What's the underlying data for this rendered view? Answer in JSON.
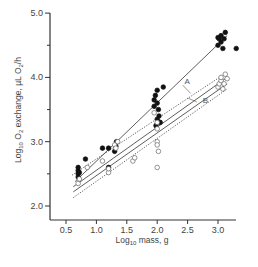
{
  "chart_data": {
    "type": "scatter",
    "title": "",
    "xlabel": "Log10 mass, g",
    "ylabel": "Log10 O2 exchange, µL O2/h",
    "xlim": [
      0.35,
      3.3
    ],
    "ylim": [
      1.8,
      5.0
    ],
    "x_ticks": [
      0.5,
      1.0,
      1.5,
      2.0,
      2.5,
      3.0
    ],
    "x_tick_labels": [
      "0.5",
      "1.0",
      "1.5",
      "2.0",
      "2.5",
      "3.0"
    ],
    "y_ticks": [
      2.0,
      3.0,
      4.0,
      5.0
    ],
    "y_tick_labels": [
      "2.0",
      "3.0",
      "4.0",
      "5.0"
    ],
    "y_minor_ticks": [
      2.5,
      3.5,
      4.5
    ],
    "grid": false,
    "legend": null,
    "series": [
      {
        "name": "filled circles",
        "marker": "filled-circle",
        "points": [
          [
            0.7,
            2.45
          ],
          [
            0.7,
            2.5
          ],
          [
            0.7,
            2.55
          ],
          [
            0.7,
            2.6
          ],
          [
            0.72,
            2.52
          ],
          [
            0.82,
            2.73
          ],
          [
            1.1,
            2.9
          ],
          [
            1.2,
            2.9
          ],
          [
            1.2,
            2.6
          ],
          [
            1.3,
            2.85
          ],
          [
            1.32,
            2.93
          ],
          [
            1.33,
            3.0
          ],
          [
            1.95,
            3.55
          ],
          [
            1.95,
            3.65
          ],
          [
            1.97,
            3.72
          ],
          [
            2.0,
            3.6
          ],
          [
            2.0,
            3.8
          ],
          [
            2.02,
            3.5
          ],
          [
            2.03,
            3.4
          ],
          [
            2.05,
            3.3
          ],
          [
            1.98,
            3.25
          ],
          [
            2.0,
            3.35
          ],
          [
            2.1,
            3.85
          ],
          [
            3.0,
            4.5
          ],
          [
            3.02,
            4.6
          ],
          [
            3.05,
            4.55
          ],
          [
            3.05,
            4.65
          ],
          [
            3.08,
            4.45
          ],
          [
            3.1,
            4.6
          ],
          [
            3.12,
            4.7
          ],
          [
            3.0,
            4.62
          ],
          [
            3.3,
            4.45
          ]
        ]
      },
      {
        "name": "open circles",
        "marker": "open-circle",
        "points": [
          [
            0.7,
            2.35
          ],
          [
            0.72,
            2.42
          ],
          [
            0.85,
            2.6
          ],
          [
            1.1,
            2.7
          ],
          [
            1.2,
            2.52
          ],
          [
            1.2,
            2.58
          ],
          [
            1.3,
            2.95
          ],
          [
            1.32,
            2.9
          ],
          [
            1.35,
            3.0
          ],
          [
            1.6,
            2.7
          ],
          [
            1.63,
            2.75
          ],
          [
            1.95,
            3.45
          ],
          [
            2.0,
            3.3
          ],
          [
            2.0,
            3.2
          ],
          [
            2.0,
            3.0
          ],
          [
            2.0,
            2.95
          ],
          [
            2.02,
            2.85
          ],
          [
            2.0,
            2.6
          ],
          [
            3.0,
            3.85
          ],
          [
            3.02,
            3.9
          ],
          [
            3.05,
            3.95
          ],
          [
            3.05,
            4.0
          ],
          [
            3.08,
            3.82
          ],
          [
            3.1,
            3.9
          ],
          [
            3.12,
            4.05
          ],
          [
            3.15,
            3.98
          ]
        ]
      }
    ],
    "fit_lines": [
      {
        "name": "filled regression",
        "style": "solid",
        "x": [
          0.65,
          3.15
        ],
        "y": [
          2.38,
          4.65
        ]
      },
      {
        "name": "A",
        "style": "solid",
        "x": [
          0.62,
          3.15
        ],
        "y": [
          2.3,
          4.0
        ]
      },
      {
        "name": "B",
        "style": "solid",
        "x": [
          0.62,
          3.15
        ],
        "y": [
          2.22,
          3.9
        ]
      },
      {
        "name": "A upper band",
        "style": "dotted",
        "x": [
          0.6,
          3.15
        ],
        "y": [
          2.48,
          4.08
        ]
      },
      {
        "name": "B lower band",
        "style": "dotted",
        "x": [
          0.62,
          3.15
        ],
        "y": [
          2.13,
          3.82
        ]
      }
    ],
    "annotations": [
      {
        "text": "A",
        "x": 2.45,
        "y": 3.9
      },
      {
        "text": "B",
        "x": 2.75,
        "y": 3.6
      }
    ]
  },
  "labels": {
    "xlabel_prefix": "Log",
    "xlabel_sub": "10",
    "xlabel_suffix": " mass, g",
    "ylabel_prefix": "Log",
    "ylabel_sub1": "10",
    "ylabel_mid": " O",
    "ylabel_sub2": "2",
    "ylabel_mid2": " exchange, µL O",
    "ylabel_sub3": "2",
    "ylabel_suffix": "/h",
    "line_a": "A",
    "line_b": "B"
  }
}
